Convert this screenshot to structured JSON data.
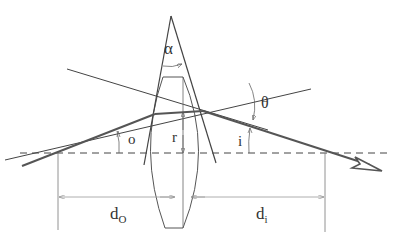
{
  "diagram": {
    "labels": {
      "alpha": "α",
      "theta": "θ",
      "o": "o",
      "i": "i",
      "r": "r",
      "d_o_main": "d",
      "d_o_sub": "O",
      "d_i_main": "d",
      "d_i_sub": "i"
    },
    "colors": {
      "ray": "#555555",
      "line": "#444444",
      "dimension": "#888888",
      "axis": "#444444",
      "text": "#333333"
    }
  }
}
